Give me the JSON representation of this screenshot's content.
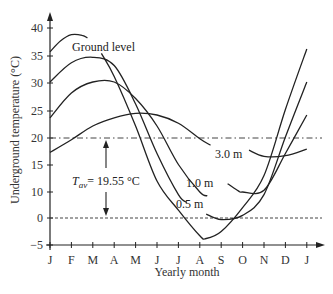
{
  "chart_data": {
    "type": "line",
    "title": "",
    "xlabel": "Yearly month",
    "ylabel": "Underground temperature (°C)",
    "categories": [
      "J",
      "F",
      "M",
      "A",
      "M",
      "J",
      "J",
      "A",
      "S",
      "O",
      "N",
      "D",
      "J"
    ],
    "y_ticks": [
      {
        "label": "40",
        "value": 40
      },
      {
        "label": "35",
        "value": 35
      },
      {
        "label": "30",
        "value": 30
      },
      {
        "label": "25",
        "value": 25
      },
      {
        "label": "20",
        "value": 20
      },
      {
        "label": "15",
        "value": 15
      },
      {
        "label": "10",
        "value": 10
      },
      {
        "label": "0",
        "value": 0
      },
      {
        "label": "−5",
        "value": -5
      }
    ],
    "ylim": [
      -5,
      42
    ],
    "grid": false,
    "series": [
      {
        "name": "Ground level",
        "x": [
          0,
          0.5,
          1,
          1.5,
          1.75
        ],
        "values": [
          35.5,
          37.5,
          38.6,
          38.5,
          38.0
        ],
        "segment": 1
      },
      {
        "name": "Ground level",
        "x": [
          2.4,
          3,
          4,
          5,
          6,
          7,
          7.3,
          8,
          9,
          10,
          11,
          12
        ],
        "values": [
          35.2,
          31,
          22,
          12,
          3,
          -3.3,
          -3.8,
          -2.5,
          4,
          13,
          25,
          36.0
        ],
        "segment": 2
      },
      {
        "name": "0.5 m",
        "x": [
          0,
          1,
          2,
          3,
          4,
          5,
          6,
          6.4
        ],
        "values": [
          30,
          33.5,
          34.5,
          33,
          26,
          17,
          9,
          6
        ],
        "segment": 1
      },
      {
        "name": "0.5 m",
        "x": [
          7.3,
          8,
          9,
          10,
          11,
          12
        ],
        "values": [
          1.5,
          -0.3,
          1,
          9,
          20,
          30
        ],
        "segment": 2
      },
      {
        "name": "1.0 m",
        "x": [
          0,
          1,
          2,
          3,
          4,
          5,
          6,
          7,
          7.35
        ],
        "values": [
          23.5,
          28,
          30,
          30,
          27,
          22,
          15,
          10,
          8.5
        ],
        "segment": 1
      },
      {
        "name": "1.0 m",
        "x": [
          8.3,
          8.8,
          9,
          10,
          11,
          12
        ],
        "values": [
          11.5,
          10.2,
          10.0,
          10.3,
          17,
          24
        ],
        "segment": 2
      },
      {
        "name": "3.0 m",
        "x": [
          0,
          1,
          2,
          3,
          4,
          5,
          6,
          7,
          7.5
        ],
        "values": [
          17.2,
          19.5,
          22,
          23.5,
          24.3,
          24,
          22.5,
          19.7,
          18.5
        ],
        "segment": 1
      },
      {
        "name": "3.0 m",
        "x": [
          9.3,
          10,
          11,
          12
        ],
        "values": [
          17.6,
          16.5,
          16.6,
          17.8
        ],
        "segment": 2
      }
    ],
    "reference_lines": [
      {
        "name": "T_av",
        "value": 19.55,
        "style": "dash-dot"
      },
      {
        "name": "zero",
        "value": 0,
        "style": "dotted"
      }
    ],
    "annotations": [
      {
        "text": "Ground level",
        "x": 3.1,
        "y": 37.5
      },
      {
        "text": "0.5 m",
        "x": 5.75,
        "y": 3.5
      },
      {
        "text": "1.0 m",
        "x": 6.85,
        "y": 9.0
      },
      {
        "text": "3.0 m",
        "x": 7.95,
        "y": 18.0
      },
      {
        "text": "T_av = 19.55 °C",
        "x": 2.2,
        "y": 12.5
      }
    ]
  },
  "labels": {
    "xlabel": "Yearly month",
    "ylabel": "Underground temperature (°C)",
    "ground": "Ground level",
    "m05": "0.5 m",
    "m10": "1.0 m",
    "m30": "3.0 m",
    "tav_T": "T",
    "tav_sub": "av",
    "tav_value": "= 19.55 °C"
  }
}
